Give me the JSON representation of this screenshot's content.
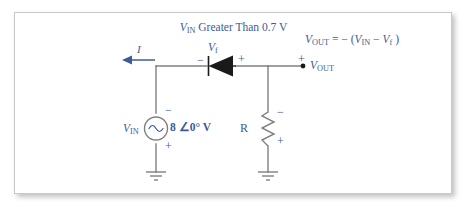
{
  "figure": {
    "kind": "circuit-schematic",
    "title_prefix_var": "V",
    "title_prefix_sub": "IN",
    "title_rest": " Greater Than 0.7 V",
    "colors": {
      "label_blue": "#3c5b9b",
      "wire_gray": "#808080",
      "diode_black": "#1a1a1a",
      "panel_border": "#c9c9c9",
      "background": "#ffffff"
    }
  },
  "equation": {
    "lhs_var": "V",
    "lhs_sub": "OUT",
    "operator": " = − (",
    "term1_var": "V",
    "term1_sub": "IN",
    "minus": " − ",
    "term2_var": "V",
    "term2_sub": "f",
    "close": " )",
    "full_text": "VOUT = −(VIN − Vf)"
  },
  "components": {
    "source": {
      "name": "ac-voltage-source",
      "label_var": "V",
      "label_sub": "IN",
      "value": "8 ∠0° V",
      "polarity_top": "−",
      "polarity_bottom": "+"
    },
    "diode": {
      "name": "diode",
      "label_var": "V",
      "label_sub": "f",
      "polarity_left": "−",
      "polarity_right": "+",
      "orientation": "cathode-left"
    },
    "resistor": {
      "name": "resistor",
      "label": "R",
      "polarity_top": "−",
      "polarity_bottom": "+"
    },
    "current": {
      "name": "current-arrow",
      "label": "I",
      "direction": "left"
    },
    "output": {
      "name": "output-terminal",
      "polarity": "+",
      "label_var": "V",
      "label_sub": "OUT"
    },
    "grounds": [
      {
        "name": "ground-left"
      },
      {
        "name": "ground-right"
      }
    ]
  }
}
